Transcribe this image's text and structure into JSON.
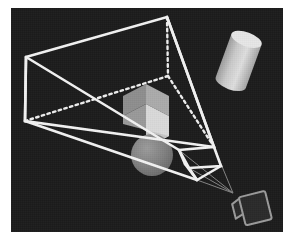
{
  "figure": {
    "canvas": {
      "width": 300,
      "height": 242
    },
    "background_color": "#ffffff",
    "plate": {
      "x": 11,
      "y": 8,
      "width": 272,
      "height": 224,
      "color": "#1c1c1c",
      "name": "dark rendering plate"
    }
  },
  "palette": {
    "background": "#ffffff",
    "plate": "#1c1c1c",
    "wireframe": "#f2f2f2",
    "wireframe_dotted": "#ededed",
    "ray": "#8a8a8a",
    "cube_front": "#d9d9d9",
    "cube_left": "#8e8e8e",
    "cube_top": "#ababab",
    "sphere": "#7e7e7e",
    "cylinder_body": "#c9c9c9",
    "cylinder_cap": "#e6e6e6",
    "camera_outline": "#9a9a9a",
    "camera_body": "#2a2a2a"
  },
  "frustum": {
    "label": "view frustum",
    "far_plane": {
      "label": "far clipping plane",
      "visible_corners": [
        {
          "name": "top-left",
          "x": 26,
          "y": 57
        },
        {
          "name": "top-right",
          "x": 166,
          "y": 16
        },
        {
          "name": "bottom-right",
          "x": 232,
          "y": 152
        },
        {
          "name": "bottom-left",
          "x": 23,
          "y": 119
        }
      ],
      "hidden_corner": {
        "name": "back-interior",
        "x": 167,
        "y": 74
      },
      "style": "solid white outline with dotted hidden edges"
    },
    "near_plane": {
      "label": "near clipping plane",
      "corners": [
        {
          "name": "top-left",
          "x": 175,
          "y": 151
        },
        {
          "name": "top-right",
          "x": 213,
          "y": 146
        },
        {
          "name": "bottom-right",
          "x": 221,
          "y": 167
        },
        {
          "name": "bottom-left",
          "x": 185,
          "y": 174
        }
      ],
      "style": "small solid white quadrilateral box"
    },
    "apex": {
      "name": "camera-center-of-projection",
      "x": 233,
      "y": 193
    },
    "hidden_edges_style": "dotted",
    "visible_edges_style": "solid"
  },
  "objects": [
    {
      "id": "cube",
      "name": "cube",
      "shape": "cube",
      "center": {
        "x": 146,
        "y": 110
      },
      "size": 46,
      "faces": [
        {
          "name": "front-right",
          "color": "#d9d9d9"
        },
        {
          "name": "left",
          "color": "#8e8e8e"
        },
        {
          "name": "top",
          "color": "#ababab"
        }
      ],
      "inside_frustum": true
    },
    {
      "id": "sphere",
      "name": "sphere",
      "shape": "sphere",
      "center": {
        "x": 152,
        "y": 155
      },
      "radius": 21,
      "color": "#7e7e7e",
      "inside_frustum": true
    },
    {
      "id": "cylinder",
      "name": "cylinder",
      "shape": "cylinder",
      "center": {
        "x": 239,
        "y": 62
      },
      "width": 34,
      "height": 58,
      "tilt_degrees": 20,
      "body_color": "#c9c9c9",
      "cap_color": "#e6e6e6",
      "inside_frustum": false
    },
    {
      "id": "camera",
      "name": "camera",
      "shape": "camera-box",
      "position": {
        "x": 253,
        "y": 210
      },
      "outline_color": "#9a9a9a",
      "body_color": "#2a2a2a",
      "inside_frustum": false
    }
  ],
  "rays": {
    "label": "projection rays from frustum corners to camera",
    "count": 4,
    "color": "#8a8a8a",
    "from_apex": {
      "x": 233,
      "y": 193
    }
  }
}
